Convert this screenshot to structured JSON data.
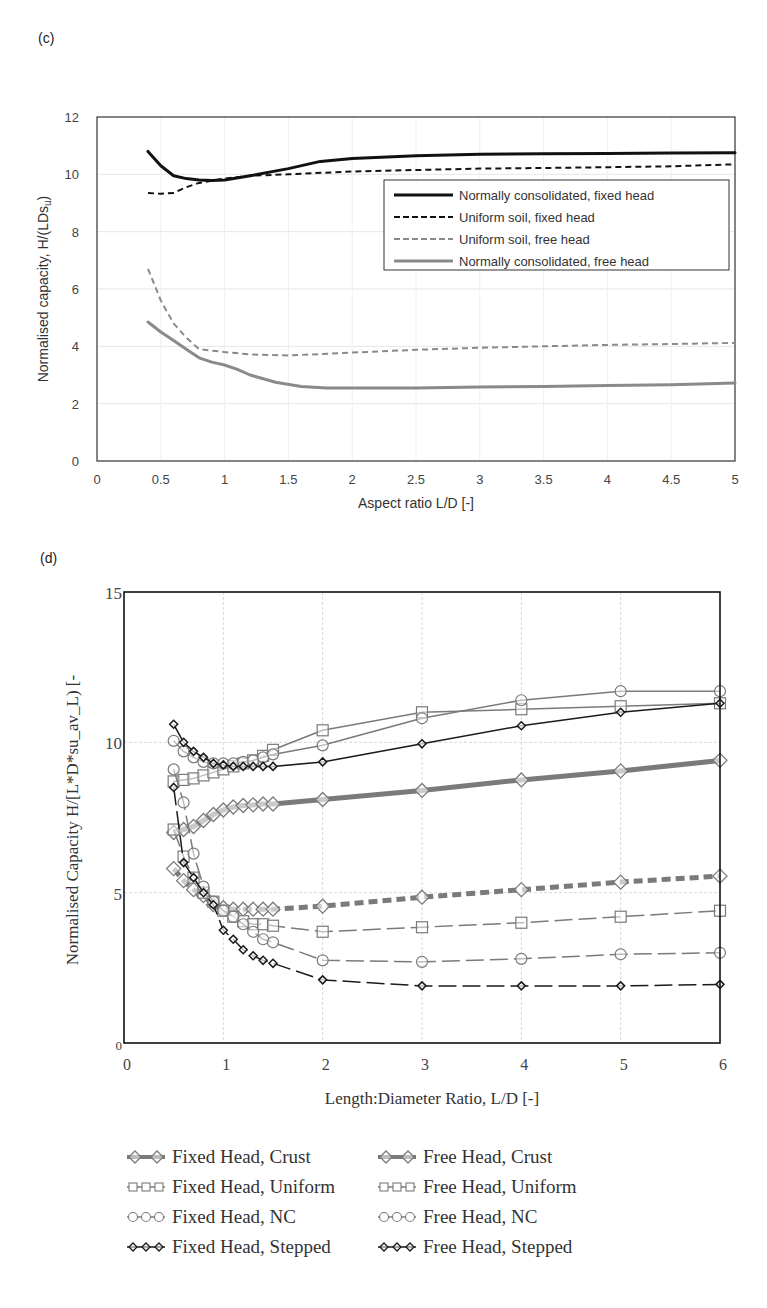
{
  "chart_data": [
    {
      "panel_label": "(c)",
      "type": "line",
      "title": "",
      "xlabel": "Aspect ratio L/D [-]",
      "ylabel": "Normalised capacity, H/(LDs",
      "ylabel_sub": "u",
      "ylabel_end": ")",
      "xlim": [
        0,
        5
      ],
      "ylim": [
        0,
        12
      ],
      "xticks": [
        "0",
        "0.5",
        "1",
        "1.5",
        "2",
        "2.5",
        "3",
        "3.5",
        "4",
        "4.5",
        "5"
      ],
      "yticks": [
        "0",
        "2",
        "4",
        "6",
        "8",
        "10",
        "12"
      ],
      "grid": true,
      "legend_position": "right-middle",
      "series": [
        {
          "name": "Normally consolidated, fixed head",
          "color": "#111111",
          "style": "solid-thick",
          "x": [
            0.4,
            0.5,
            0.6,
            0.7,
            0.8,
            0.9,
            1.0,
            1.2,
            1.5,
            1.75,
            2.0,
            2.5,
            3.0,
            3.5,
            4.0,
            4.5,
            5.0
          ],
          "y": [
            10.8,
            10.3,
            9.95,
            9.85,
            9.8,
            9.78,
            9.8,
            9.95,
            10.2,
            10.45,
            10.55,
            10.65,
            10.7,
            10.72,
            10.73,
            10.74,
            10.75
          ]
        },
        {
          "name": "Uniform soil, fixed head",
          "color": "#111111",
          "style": "dashed",
          "x": [
            0.4,
            0.5,
            0.6,
            0.7,
            0.8,
            1.0,
            1.2,
            1.5,
            2.0,
            2.5,
            3.0,
            3.5,
            4.0,
            4.5,
            5.0
          ],
          "y": [
            9.35,
            9.32,
            9.35,
            9.55,
            9.7,
            9.85,
            9.95,
            10.0,
            10.1,
            10.15,
            10.2,
            10.22,
            10.25,
            10.28,
            10.35
          ]
        },
        {
          "name": "Uniform soil, free head",
          "color": "#8a8a8a",
          "style": "dashed",
          "x": [
            0.4,
            0.5,
            0.6,
            0.7,
            0.8,
            0.9,
            1.0,
            1.2,
            1.5,
            2.0,
            2.5,
            3.0,
            3.5,
            4.0,
            4.5,
            5.0
          ],
          "y": [
            6.7,
            5.6,
            4.8,
            4.3,
            3.9,
            3.85,
            3.8,
            3.72,
            3.68,
            3.78,
            3.88,
            3.95,
            4.0,
            4.05,
            4.08,
            4.12
          ]
        },
        {
          "name": "Normally consolidated, free head",
          "color": "#8a8a8a",
          "style": "solid-thick",
          "x": [
            0.4,
            0.5,
            0.6,
            0.7,
            0.8,
            0.9,
            1.0,
            1.1,
            1.2,
            1.4,
            1.6,
            1.8,
            2.0,
            2.5,
            3.0,
            3.5,
            4.0,
            4.5,
            5.0
          ],
          "y": [
            4.85,
            4.5,
            4.2,
            3.9,
            3.6,
            3.45,
            3.35,
            3.2,
            3.0,
            2.75,
            2.6,
            2.55,
            2.55,
            2.55,
            2.58,
            2.6,
            2.63,
            2.66,
            2.72
          ]
        }
      ]
    },
    {
      "panel_label": "(d)",
      "type": "line",
      "title": "",
      "xlabel": "Length:Diameter Ratio, L/D [-]",
      "ylabel": "Normalised Capacity H/[L*D*su_av_L) [-",
      "xlim": [
        0,
        6
      ],
      "ylim": [
        0,
        15
      ],
      "xticks": [
        "0",
        "1",
        "2",
        "3",
        "4",
        "5",
        "6"
      ],
      "yticks": [
        "0",
        "5",
        "10",
        "15"
      ],
      "grid": true,
      "legend_position": "bottom",
      "series": [
        {
          "name": "Fixed Head, Crust",
          "color": "#7a7a7a",
          "line": "solid",
          "marker": "diamond",
          "width": "thick",
          "x": [
            0.5,
            0.6,
            0.7,
            0.8,
            0.9,
            1.0,
            1.1,
            1.2,
            1.3,
            1.4,
            1.5,
            2,
            3,
            4,
            5,
            6
          ],
          "y": [
            7.0,
            7.1,
            7.2,
            7.4,
            7.6,
            7.75,
            7.85,
            7.9,
            7.92,
            7.95,
            7.95,
            8.1,
            8.4,
            8.75,
            9.05,
            9.4
          ]
        },
        {
          "name": "Free Head, Crust",
          "color": "#7a7a7a",
          "line": "dashed",
          "marker": "diamond",
          "width": "thick",
          "x": [
            0.5,
            0.6,
            0.7,
            0.8,
            0.9,
            1.0,
            1.1,
            1.2,
            1.3,
            1.4,
            1.5,
            2,
            3,
            4,
            5,
            6
          ],
          "y": [
            5.8,
            5.4,
            5.1,
            4.9,
            4.6,
            4.5,
            4.45,
            4.45,
            4.45,
            4.45,
            4.45,
            4.55,
            4.85,
            5.1,
            5.35,
            5.55
          ]
        },
        {
          "name": "Fixed Head, Uniform",
          "color": "#7a7a7a",
          "line": "solid",
          "marker": "square",
          "width": "thin",
          "x": [
            0.5,
            0.6,
            0.7,
            0.8,
            0.9,
            1.0,
            1.1,
            1.2,
            1.3,
            1.4,
            1.5,
            2,
            3,
            4,
            5,
            6
          ],
          "y": [
            8.7,
            8.75,
            8.8,
            8.9,
            9.0,
            9.1,
            9.2,
            9.3,
            9.4,
            9.55,
            9.75,
            10.4,
            11.0,
            11.1,
            11.2,
            11.3
          ]
        },
        {
          "name": "Free Head, Uniform",
          "color": "#7a7a7a",
          "line": "longdash",
          "marker": "square",
          "width": "thin",
          "x": [
            0.5,
            0.6,
            0.7,
            0.8,
            0.9,
            1.0,
            1.1,
            1.2,
            1.3,
            1.4,
            1.5,
            2,
            3,
            4,
            5,
            6
          ],
          "y": [
            7.1,
            6.2,
            5.5,
            5.0,
            4.7,
            4.4,
            4.2,
            4.05,
            3.95,
            3.95,
            3.9,
            3.7,
            3.85,
            4.0,
            4.2,
            4.4
          ]
        },
        {
          "name": "Fixed Head, NC",
          "color": "#7a7a7a",
          "line": "solid",
          "marker": "circle",
          "width": "thin",
          "x": [
            0.5,
            0.6,
            0.7,
            0.8,
            0.9,
            1.0,
            1.1,
            1.2,
            1.3,
            1.4,
            1.5,
            2,
            3,
            4,
            5,
            6
          ],
          "y": [
            10.05,
            9.7,
            9.5,
            9.35,
            9.3,
            9.3,
            9.3,
            9.35,
            9.4,
            9.5,
            9.6,
            9.9,
            10.8,
            11.4,
            11.7,
            11.7
          ]
        },
        {
          "name": "Free Head, NC",
          "color": "#7a7a7a",
          "line": "longdash",
          "marker": "circle",
          "width": "thin",
          "x": [
            0.5,
            0.6,
            0.7,
            0.8,
            0.9,
            1.0,
            1.1,
            1.2,
            1.3,
            1.4,
            1.5,
            2,
            3,
            4,
            5,
            6
          ],
          "y": [
            9.1,
            8.0,
            6.3,
            5.2,
            4.7,
            4.4,
            4.2,
            3.95,
            3.7,
            3.45,
            3.35,
            2.75,
            2.7,
            2.8,
            2.95,
            3.0
          ]
        },
        {
          "name": "Fixed Head, Stepped",
          "color": "#1a1a1a",
          "line": "solid",
          "marker": "diamond-small",
          "width": "thin",
          "x": [
            0.5,
            0.6,
            0.7,
            0.8,
            0.9,
            1.0,
            1.1,
            1.2,
            1.3,
            1.4,
            1.5,
            2,
            3,
            4,
            5,
            6
          ],
          "y": [
            10.6,
            10.0,
            9.7,
            9.5,
            9.3,
            9.25,
            9.2,
            9.2,
            9.2,
            9.2,
            9.2,
            9.35,
            9.95,
            10.55,
            11.0,
            11.3
          ]
        },
        {
          "name": "Free Head, Stepped",
          "color": "#1a1a1a",
          "line": "longdash",
          "marker": "diamond-small",
          "width": "thin",
          "x": [
            0.5,
            0.6,
            0.7,
            0.8,
            0.9,
            1.0,
            1.1,
            1.2,
            1.3,
            1.4,
            1.5,
            2,
            3,
            4,
            5,
            6
          ],
          "y": [
            8.5,
            6.0,
            5.5,
            5.0,
            4.6,
            3.75,
            3.45,
            3.1,
            2.9,
            2.75,
            2.65,
            2.1,
            1.9,
            1.9,
            1.9,
            1.95
          ]
        }
      ]
    }
  ]
}
